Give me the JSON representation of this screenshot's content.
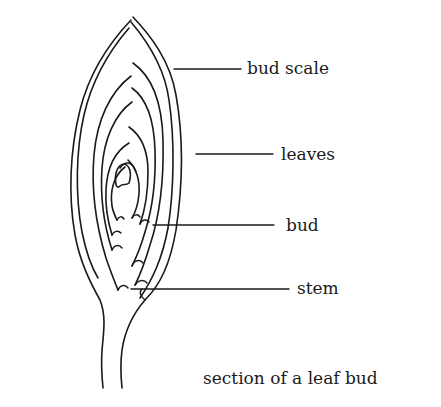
{
  "diagram": {
    "title": "section of a leaf bud",
    "labels": [
      {
        "id": "bud-scale",
        "text": "bud scale"
      },
      {
        "id": "leaves",
        "text": "leaves"
      },
      {
        "id": "bud",
        "text": "bud"
      },
      {
        "id": "stem",
        "text": "stem"
      }
    ],
    "colors": {
      "ink": "#1a1a1a",
      "background": "#ffffff"
    }
  }
}
